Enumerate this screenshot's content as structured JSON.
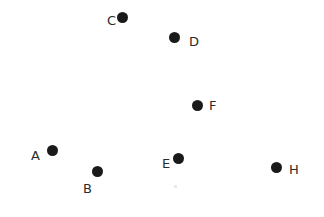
{
  "figure": {
    "background_color": "#ffffff",
    "dot_color": "#1a1a1a",
    "label_color": "#2b2b2b",
    "width": 324,
    "height": 217
  },
  "chart_data": {
    "type": "scatter",
    "title": "",
    "xlabel": "",
    "ylabel": "",
    "xlim": [
      0,
      324
    ],
    "ylim": [
      0,
      217
    ],
    "grid": false,
    "axes_visible": false,
    "legend": "none",
    "marker": {
      "shape": "circle",
      "color": "#1a1a1a",
      "diameter_px": 11
    },
    "points": [
      {
        "label": "A",
        "x": 52,
        "y": 150,
        "label_x": 31,
        "label_y": 149,
        "label_side": "left"
      },
      {
        "label": "B",
        "x": 97,
        "y": 171,
        "label_x": 83,
        "label_y": 182,
        "label_side": "lower-left"
      },
      {
        "label": "C",
        "x": 122,
        "y": 17,
        "label_x": 107,
        "label_y": 14,
        "label_side": "left"
      },
      {
        "label": "D",
        "x": 174,
        "y": 37,
        "label_x": 189,
        "label_y": 35,
        "label_side": "right"
      },
      {
        "label": "E",
        "x": 178,
        "y": 158,
        "label_x": 162,
        "label_y": 157,
        "label_side": "left"
      },
      {
        "label": "F",
        "x": 197,
        "y": 105,
        "label_x": 209,
        "label_y": 99,
        "label_side": "upper-right"
      },
      {
        "label": "H",
        "x": 276,
        "y": 167,
        "label_x": 289,
        "label_y": 163,
        "label_side": "upper-right"
      }
    ],
    "point_count": 7,
    "labels": [
      "A",
      "B",
      "C",
      "D",
      "E",
      "F",
      "H"
    ]
  }
}
